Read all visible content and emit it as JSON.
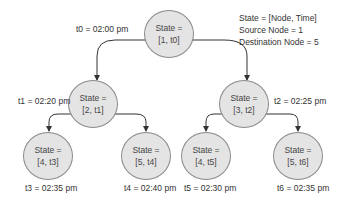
{
  "legend": {
    "line1": "State = [Node, Time]",
    "line2": "Source Node = 1",
    "line3": "Destination Node = 5"
  },
  "nodes": [
    {
      "id": "root",
      "line1": "State =",
      "line2": "[1, t0]",
      "time_label": "t0 = 02:00 pm"
    },
    {
      "id": "left",
      "line1": "State =",
      "line2": "[2, t1]",
      "time_label": "t1 = 02:20 pm"
    },
    {
      "id": "right",
      "line1": "State =",
      "line2": "[3, t2]",
      "time_label": "t2 = 02:25 pm"
    },
    {
      "id": "ll",
      "line1": "State =",
      "line2": "[4, t3]",
      "time_label": "t3 = 02:35 pm"
    },
    {
      "id": "lr",
      "line1": "State =",
      "line2": "[5, t4]",
      "time_label": "t4 = 02:40 pm"
    },
    {
      "id": "rl",
      "line1": "State =",
      "line2": "[4, t5]",
      "time_label": "t5 = 02:30 pm"
    },
    {
      "id": "rr",
      "line1": "State =",
      "line2": "[5, t6]",
      "time_label": "t6 = 02:35 pm"
    }
  ],
  "edges": [
    {
      "from": "root",
      "to": "left"
    },
    {
      "from": "root",
      "to": "right"
    },
    {
      "from": "left",
      "to": "ll"
    },
    {
      "from": "left",
      "to": "lr"
    },
    {
      "from": "right",
      "to": "rl"
    },
    {
      "from": "right",
      "to": "rr"
    }
  ]
}
